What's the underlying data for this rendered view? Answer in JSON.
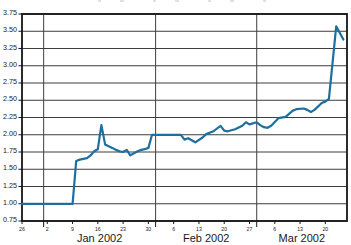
{
  "chart_data": {
    "type": "line",
    "title": "",
    "grid": true,
    "legend_position": "none",
    "y_axis": {
      "min": 0.75,
      "max": 3.75,
      "step": 0.25,
      "tick_labels": [
        "3.75",
        "3.50",
        "3.25",
        "3.00",
        "2.75",
        "2.50",
        "2.25",
        "2.00",
        "1.75",
        "1.50",
        "1.25",
        "1.00",
        "0.75"
      ]
    },
    "x_axis": {
      "domain_days": [
        0,
        90
      ],
      "week_tick_days": [
        0,
        7,
        14,
        21,
        28,
        35,
        42,
        49,
        56,
        63,
        70,
        77,
        84
      ],
      "week_tick_labels": [
        "26",
        "2",
        "9",
        "16",
        "23",
        "30",
        "6",
        "13",
        "20",
        "27",
        "6",
        "13",
        "20"
      ],
      "month_boundary_days": [
        6,
        37,
        65
      ],
      "month_labels": [
        {
          "label": "Jan 2002",
          "center_day": 21.5
        },
        {
          "label": "Feb 2002",
          "center_day": 51
        },
        {
          "label": "Mar 2002",
          "center_day": 77.5
        }
      ]
    },
    "series": [
      {
        "name": "price",
        "color": "#1c6f9f",
        "points": [
          [
            0,
            1.0
          ],
          [
            14,
            1.0
          ],
          [
            15,
            1.62
          ],
          [
            16,
            1.64
          ],
          [
            18,
            1.66
          ],
          [
            19,
            1.7
          ],
          [
            20,
            1.76
          ],
          [
            21,
            1.79
          ],
          [
            22,
            2.14
          ],
          [
            23,
            1.86
          ],
          [
            25,
            1.81
          ],
          [
            26,
            1.78
          ],
          [
            27,
            1.76
          ],
          [
            28,
            1.75
          ],
          [
            29,
            1.78
          ],
          [
            30,
            1.7
          ],
          [
            32,
            1.76
          ],
          [
            33,
            1.78
          ],
          [
            34,
            1.79
          ],
          [
            35,
            1.81
          ],
          [
            36,
            2.0
          ],
          [
            44,
            2.0
          ],
          [
            45,
            1.93
          ],
          [
            46,
            1.95
          ],
          [
            48,
            1.89
          ],
          [
            50,
            1.96
          ],
          [
            51,
            2.01
          ],
          [
            53,
            2.05
          ],
          [
            54,
            2.09
          ],
          [
            55,
            2.13
          ],
          [
            56,
            2.06
          ],
          [
            57,
            2.05
          ],
          [
            59,
            2.08
          ],
          [
            61,
            2.13
          ],
          [
            62,
            2.18
          ],
          [
            63,
            2.15
          ],
          [
            65,
            2.18
          ],
          [
            66,
            2.14
          ],
          [
            67,
            2.11
          ],
          [
            68,
            2.1
          ],
          [
            69,
            2.13
          ],
          [
            71,
            2.24
          ],
          [
            73,
            2.26
          ],
          [
            75,
            2.35
          ],
          [
            76,
            2.37
          ],
          [
            78,
            2.38
          ],
          [
            79,
            2.36
          ],
          [
            80,
            2.33
          ],
          [
            81,
            2.36
          ],
          [
            83,
            2.46
          ],
          [
            84,
            2.48
          ],
          [
            85,
            2.52
          ],
          [
            86,
            3.05
          ],
          [
            87,
            3.57
          ],
          [
            89,
            3.38
          ]
        ]
      }
    ]
  },
  "colors": {
    "background": "#ffffff",
    "grid": "#3d3d3d",
    "border": "#161616",
    "text": "#1a1a1a",
    "line": "#1c6f9f"
  }
}
